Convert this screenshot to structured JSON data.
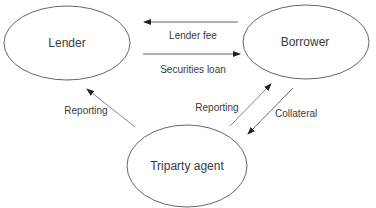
{
  "diagram": {
    "colors": {
      "stroke": "#555555",
      "text": "#3a3a3a",
      "background": "#ffffff"
    },
    "nodes": [
      {
        "id": "lender",
        "label": "Lender",
        "cx": 67,
        "cy": 43,
        "rx": 63,
        "ry": 37
      },
      {
        "id": "borrower",
        "label": "Borrower",
        "cx": 306,
        "cy": 42,
        "rx": 63,
        "ry": 37
      },
      {
        "id": "triparty",
        "label": "Triparty agent",
        "cx": 187,
        "cy": 166,
        "rx": 60,
        "ry": 41
      }
    ],
    "edges": [
      {
        "id": "lender-fee",
        "from": "borrower",
        "to": "lender",
        "label": "Lender fee"
      },
      {
        "id": "securities-loan",
        "from": "lender",
        "to": "borrower",
        "label": "Securities loan"
      },
      {
        "id": "reporting-to-lender",
        "from": "triparty",
        "to": "lender",
        "label": "Reporting"
      },
      {
        "id": "reporting-to-borrower",
        "from": "triparty",
        "to": "borrower",
        "label": "Reporting"
      },
      {
        "id": "collateral",
        "from": "borrower",
        "to": "triparty",
        "label": "Collateral"
      }
    ]
  }
}
